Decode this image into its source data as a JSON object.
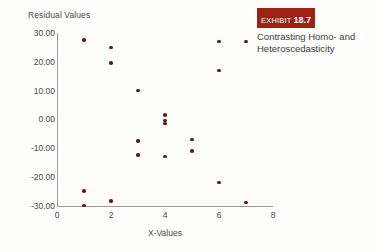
{
  "exhibit": {
    "badge_word": "EXHIBIT",
    "badge_number": "18.7",
    "badge_color": "#9e2213",
    "caption_line1": "Contrasting Homo- and",
    "caption_line2": "Heteroscedasticity"
  },
  "chart_data": {
    "type": "scatter",
    "title": "Residual Values",
    "xlabel": "X-Values",
    "ylabel": "Residual Values",
    "xlim": [
      0,
      8
    ],
    "ylim": [
      -30,
      30
    ],
    "grid": false,
    "legend": null,
    "point_color": "#5c1a1a",
    "axis_color": "#9a9a9a",
    "xticks": [
      "0",
      "2",
      "4",
      "6",
      "8"
    ],
    "xtick_values": [
      0,
      2,
      4,
      6,
      8
    ],
    "yticks": [
      "30.00",
      "20.00",
      "10.00",
      "0.00",
      "-10.00",
      "-20.00",
      "-30.00"
    ],
    "ytick_values": [
      30,
      20,
      10,
      0,
      -10,
      -20,
      -30
    ],
    "x": [
      1,
      1,
      1,
      2,
      2,
      2,
      3,
      3,
      3,
      4,
      4,
      4,
      4,
      5,
      5,
      6,
      6,
      6,
      7,
      7
    ],
    "y": [
      27.5,
      -25.0,
      -30.0,
      25.0,
      19.5,
      -28.5,
      10.0,
      -7.5,
      -12.5,
      1.5,
      -0.5,
      -1.5,
      -13.0,
      -7.0,
      -11.0,
      27.0,
      17.0,
      -22.0,
      27.0,
      -29.0
    ],
    "points": [
      {
        "x": 1,
        "y": 27.5
      },
      {
        "x": 1,
        "y": -25.0
      },
      {
        "x": 1,
        "y": -30.0
      },
      {
        "x": 2,
        "y": 25.0
      },
      {
        "x": 2,
        "y": 19.5
      },
      {
        "x": 2,
        "y": -28.5
      },
      {
        "x": 3,
        "y": 10.0
      },
      {
        "x": 3,
        "y": -7.5
      },
      {
        "x": 3,
        "y": -12.5
      },
      {
        "x": 4,
        "y": 1.5
      },
      {
        "x": 4,
        "y": -0.5
      },
      {
        "x": 4,
        "y": -1.5
      },
      {
        "x": 4,
        "y": -13.0
      },
      {
        "x": 5,
        "y": -7.0
      },
      {
        "x": 5,
        "y": -11.0
      },
      {
        "x": 6,
        "y": 27.0
      },
      {
        "x": 6,
        "y": 17.0
      },
      {
        "x": 6,
        "y": -22.0
      },
      {
        "x": 7,
        "y": 27.0
      },
      {
        "x": 7,
        "y": -29.0
      }
    ]
  }
}
